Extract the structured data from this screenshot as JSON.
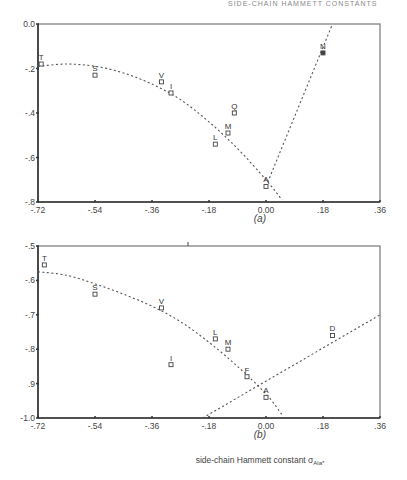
{
  "running_head": "SIDE-CHAIN HAMMETT CONSTANTS",
  "xlabel": "side-chain Hammett constant σ",
  "xlabel_sub": "Ala*",
  "chart_data": [
    {
      "type": "scatter",
      "caption": "(a)",
      "title": "",
      "xlabel": "side-chain Hammett constant σAla*",
      "ylabel": "",
      "xlim": [
        -0.72,
        0.36
      ],
      "ylim": [
        -0.8,
        0.0
      ],
      "xticks": [
        "-.72",
        "-.54",
        "-.36",
        "-.18",
        "0.00",
        ".18",
        ".36"
      ],
      "xtick_values": [
        -0.72,
        -0.54,
        -0.36,
        -0.18,
        0.0,
        0.18,
        0.36
      ],
      "yticks": [
        "0.0",
        "-.2",
        "-.4",
        "-.6",
        "-.8"
      ],
      "ytick_values": [
        0.0,
        -0.2,
        -0.4,
        -0.6,
        -0.8
      ],
      "grid": false,
      "points": [
        {
          "label": "T",
          "x": -0.71,
          "y": -0.18
        },
        {
          "label": "S",
          "x": -0.54,
          "y": -0.23
        },
        {
          "label": "V",
          "x": -0.33,
          "y": -0.26
        },
        {
          "label": "I",
          "x": -0.3,
          "y": -0.31
        },
        {
          "label": "Q",
          "x": -0.1,
          "y": -0.4
        },
        {
          "label": "M",
          "x": -0.12,
          "y": -0.49
        },
        {
          "label": "L",
          "x": -0.16,
          "y": -0.54
        },
        {
          "label": "A",
          "x": 0.0,
          "y": -0.73
        },
        {
          "label": "N",
          "x": 0.18,
          "y": -0.13
        }
      ],
      "fit_lines": [
        {
          "name": "quadratic fit (left branch)",
          "style": "dotted",
          "x": [
            -0.72,
            -0.63,
            -0.54,
            -0.45,
            -0.36,
            -0.27,
            -0.18,
            -0.09,
            0.0,
            0.05
          ],
          "y": [
            -0.19,
            -0.18,
            -0.19,
            -0.22,
            -0.27,
            -0.34,
            -0.44,
            -0.56,
            -0.7,
            -0.79
          ]
        },
        {
          "name": "linear fit (right branch)",
          "style": "dotted",
          "x": [
            0.0,
            0.21
          ],
          "y": [
            -0.73,
            0.0
          ]
        }
      ]
    },
    {
      "type": "scatter",
      "caption": "(b)",
      "title": "",
      "xlabel": "side-chain Hammett constant σAla*",
      "ylabel": "",
      "xlim": [
        -0.72,
        0.36
      ],
      "ylim": [
        -1.0,
        -0.5
      ],
      "xticks": [
        "-.72",
        "-.54",
        "-.36",
        "-.18",
        "0.00",
        ".18",
        ".36"
      ],
      "xtick_values": [
        -0.72,
        -0.54,
        -0.36,
        -0.18,
        0.0,
        0.18,
        0.36
      ],
      "yticks": [
        "-.5",
        "-.6",
        "-.7",
        "-.8",
        ".9",
        "-1.0"
      ],
      "ytick_values": [
        -0.5,
        -0.6,
        -0.7,
        -0.8,
        -0.9,
        -1.0
      ],
      "grid": false,
      "points": [
        {
          "label": "T",
          "x": -0.7,
          "y": -0.555
        },
        {
          "label": "S",
          "x": -0.54,
          "y": -0.64
        },
        {
          "label": "V",
          "x": -0.33,
          "y": -0.68
        },
        {
          "label": "I",
          "x": -0.3,
          "y": -0.845
        },
        {
          "label": "L",
          "x": -0.16,
          "y": -0.77
        },
        {
          "label": "M",
          "x": -0.12,
          "y": -0.8
        },
        {
          "label": "F",
          "x": -0.06,
          "y": -0.88
        },
        {
          "label": "A",
          "x": 0.0,
          "y": -0.94
        },
        {
          "label": "D",
          "x": 0.21,
          "y": -0.76
        }
      ],
      "fit_lines": [
        {
          "name": "quadratic fit (left branch)",
          "style": "dotted",
          "x": [
            -0.72,
            -0.63,
            -0.54,
            -0.45,
            -0.36,
            -0.27,
            -0.18,
            -0.09,
            0.0,
            0.05
          ],
          "y": [
            -0.575,
            -0.585,
            -0.61,
            -0.64,
            -0.675,
            -0.72,
            -0.78,
            -0.85,
            -0.93,
            -0.99
          ]
        },
        {
          "name": "linear fit (right branch)",
          "style": "dotted",
          "x": [
            -0.2,
            0.36
          ],
          "y": [
            -1.0,
            -0.7
          ]
        }
      ]
    }
  ]
}
